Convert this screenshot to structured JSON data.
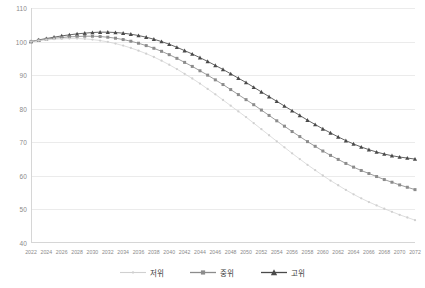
{
  "chart_data": {
    "type": "line",
    "title": "",
    "subtitle": "",
    "xlabel": "",
    "ylabel": "",
    "xlim": [
      2022,
      2072
    ],
    "ylim": [
      40,
      110
    ],
    "ytick_step": 10,
    "xtick_step": 2,
    "grid": true,
    "legend_position": "bottom",
    "yticks": [
      110,
      100,
      90,
      80,
      70,
      60,
      50,
      40
    ],
    "xticks": [
      2022,
      2024,
      2026,
      2028,
      2030,
      2032,
      2034,
      2036,
      2038,
      2040,
      2042,
      2044,
      2046,
      2048,
      2050,
      2052,
      2054,
      2056,
      2058,
      2060,
      2062,
      2064,
      2066,
      2068,
      2070,
      2072
    ],
    "x": [
      2022,
      2023,
      2024,
      2025,
      2026,
      2027,
      2028,
      2029,
      2030,
      2031,
      2032,
      2033,
      2034,
      2035,
      2036,
      2037,
      2038,
      2039,
      2040,
      2041,
      2042,
      2043,
      2044,
      2045,
      2046,
      2047,
      2048,
      2049,
      2050,
      2051,
      2052,
      2053,
      2054,
      2055,
      2056,
      2057,
      2058,
      2059,
      2060,
      2061,
      2062,
      2063,
      2064,
      2065,
      2066,
      2067,
      2068,
      2069,
      2070,
      2071,
      2072
    ],
    "series": [
      {
        "name": "고위",
        "marker": "triangle",
        "color": "#4a4a4a",
        "values": [
          100.0,
          100.5,
          100.9,
          101.3,
          101.7,
          102.0,
          102.3,
          102.5,
          102.7,
          102.8,
          102.8,
          102.7,
          102.5,
          102.2,
          101.8,
          101.3,
          100.7,
          100.0,
          99.2,
          98.3,
          97.3,
          96.3,
          95.2,
          94.1,
          92.9,
          91.7,
          90.4,
          89.1,
          87.8,
          86.4,
          85.0,
          83.6,
          82.2,
          80.8,
          79.4,
          78.0,
          76.6,
          75.3,
          74.0,
          72.8,
          71.6,
          70.5,
          69.5,
          68.6,
          67.8,
          67.1,
          66.5,
          66.0,
          65.6,
          65.3,
          65.0
        ]
      },
      {
        "name": "중위",
        "marker": "square",
        "color": "#8c8c8c",
        "values": [
          100.0,
          100.4,
          100.7,
          101.0,
          101.2,
          101.4,
          101.5,
          101.6,
          101.6,
          101.5,
          101.3,
          101.0,
          100.6,
          100.1,
          99.5,
          98.8,
          98.0,
          97.1,
          96.1,
          95.0,
          93.8,
          92.6,
          91.3,
          90.0,
          88.6,
          87.2,
          85.7,
          84.2,
          82.7,
          81.2,
          79.6,
          78.0,
          76.4,
          74.8,
          73.2,
          71.7,
          70.2,
          68.8,
          67.4,
          66.1,
          64.9,
          63.7,
          62.6,
          61.6,
          60.7,
          59.8,
          58.9,
          58.1,
          57.3,
          56.6,
          55.9
        ]
      },
      {
        "name": "저위",
        "marker": "dot",
        "color": "#d0d0d0",
        "values": [
          100.0,
          100.3,
          100.5,
          100.7,
          100.8,
          100.9,
          100.9,
          100.8,
          100.6,
          100.3,
          99.9,
          99.4,
          98.8,
          98.1,
          97.3,
          96.4,
          95.4,
          94.3,
          93.1,
          91.8,
          90.4,
          89.0,
          87.5,
          85.9,
          84.3,
          82.6,
          80.9,
          79.2,
          77.5,
          75.7,
          73.9,
          72.1,
          70.3,
          68.5,
          66.7,
          65.0,
          63.3,
          61.7,
          60.1,
          58.6,
          57.2,
          55.8,
          54.5,
          53.3,
          52.2,
          51.2,
          50.2,
          49.3,
          48.4,
          47.6,
          46.8
        ]
      }
    ]
  },
  "legend": {
    "items": [
      {
        "label": "저위"
      },
      {
        "label": "중위"
      },
      {
        "label": "고위"
      }
    ]
  }
}
